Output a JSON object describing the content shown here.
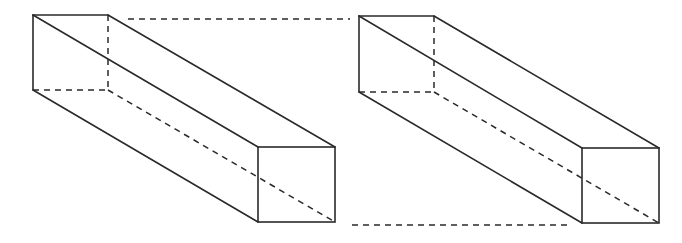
{
  "diagram": {
    "type": "geometry-figure",
    "colors": {
      "background": "#ffffff",
      "stroke": "#2a2a2a"
    },
    "prisms": [
      {
        "id": "left-prism",
        "back_face": {
          "tl": [
            33,
            15
          ],
          "tr": [
            108,
            15
          ],
          "br": [
            108,
            90
          ],
          "bl": [
            33,
            90
          ]
        },
        "front_face": {
          "tl": [
            258,
            147
          ],
          "tr": [
            335,
            147
          ],
          "br": [
            335,
            222
          ],
          "bl": [
            258,
            222
          ]
        },
        "hidden_edges": [
          "back-top-right to back-bottom-right",
          "back-bottom-left to back-bottom-right",
          "back-bottom-right to front-bottom-right"
        ]
      },
      {
        "id": "right-prism",
        "back_face": {
          "tl": [
            359,
            16
          ],
          "tr": [
            434,
            16
          ],
          "br": [
            434,
            92
          ],
          "bl": [
            359,
            92
          ]
        },
        "front_face": {
          "tl": [
            582,
            148
          ],
          "tr": [
            659,
            148
          ],
          "br": [
            659,
            223
          ],
          "bl": [
            582,
            223
          ]
        },
        "hidden_edges": [
          "back-top-right to back-bottom-right",
          "back-bottom-left to back-bottom-right",
          "back-bottom-right to front-bottom-right"
        ]
      }
    ],
    "connectors": [
      {
        "id": "top-connector",
        "from": [
          128,
          19
        ],
        "to": [
          350,
          19
        ],
        "style": "dashed"
      },
      {
        "id": "bottom-connector",
        "from": [
          352,
          225
        ],
        "to": [
          568,
          225
        ],
        "style": "dashed"
      }
    ],
    "labels": []
  }
}
